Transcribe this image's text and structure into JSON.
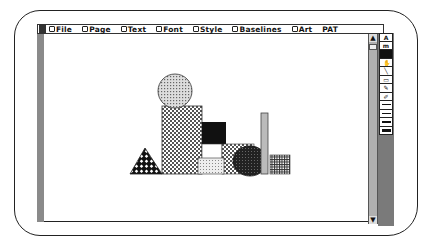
{
  "menubar": {
    "items": [
      {
        "label": "File"
      },
      {
        "label": "Page"
      },
      {
        "label": "Text"
      },
      {
        "label": "Font"
      },
      {
        "label": "Style"
      },
      {
        "label": "Baselines"
      },
      {
        "label": "Art"
      },
      {
        "label": "PAT",
        "no_icon": true
      }
    ]
  },
  "scrollbar": {
    "up_arrow": "▲",
    "down_arrow": "▼"
  },
  "palette": {
    "tools": [
      {
        "name": "text-tool",
        "glyph": "A"
      },
      {
        "name": "gravity-tool",
        "glyph": "m"
      },
      {
        "name": "selected-fill-tool",
        "glyph": "",
        "selected": true
      },
      {
        "name": "hand-tool",
        "glyph": "✋"
      },
      {
        "name": "line-tool",
        "glyph": "╲"
      },
      {
        "name": "rectangle-tool",
        "glyph": "▭"
      },
      {
        "name": "pencil-tool",
        "glyph": "✎"
      },
      {
        "name": "eraser-tool",
        "glyph": "✐"
      },
      {
        "name": "line-weight-1",
        "line": 1
      },
      {
        "name": "line-weight-2",
        "line": 1.5
      },
      {
        "name": "line-weight-3",
        "line": 2
      },
      {
        "name": "line-weight-4",
        "line": 3
      }
    ]
  },
  "canvas": {
    "shapes": [
      {
        "type": "circle",
        "pattern": "dots",
        "label": "circle"
      },
      {
        "type": "rect",
        "pattern": "checker",
        "label": "tall-rectangle"
      },
      {
        "type": "triangle",
        "pattern": "diamond-grid",
        "label": "triangle"
      },
      {
        "type": "rect",
        "pattern": "solid-black",
        "label": "black-square"
      },
      {
        "type": "rect",
        "pattern": "white",
        "label": "white-square"
      },
      {
        "type": "rect",
        "pattern": "light-checker",
        "label": "small-rectangle"
      },
      {
        "type": "rect",
        "pattern": "checker",
        "label": "medium-rectangle"
      },
      {
        "type": "ellipse",
        "pattern": "dark-dots",
        "label": "dark-ellipse"
      },
      {
        "type": "rect",
        "pattern": "gray",
        "label": "tall-thin-bar"
      },
      {
        "type": "rect",
        "pattern": "grid",
        "label": "grid-square"
      }
    ]
  },
  "colors": {
    "bezel": "#222222",
    "bar_gray": "#8a8a8a",
    "scroll_gray": "#b0b0b0",
    "palette_gray": "#7a7a7a"
  }
}
